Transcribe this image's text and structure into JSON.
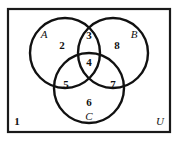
{
  "figure": {
    "type": "venn-diagram",
    "set_count": 3,
    "background_color": "#ffffff",
    "stroke_color": "#111111"
  },
  "universe": {
    "label": "U",
    "rect": {
      "x": 8,
      "y": 9,
      "width": 162,
      "height": 123
    }
  },
  "sets": [
    {
      "key": "A",
      "label": "A",
      "cx": 65,
      "cy": 53,
      "r": 35,
      "label_x": 44,
      "label_y": 35
    },
    {
      "key": "B",
      "label": "B",
      "cx": 113,
      "cy": 53,
      "r": 35,
      "label_x": 134,
      "label_y": 35
    },
    {
      "key": "C",
      "label": "C",
      "cx": 89,
      "cy": 88,
      "r": 35,
      "label_x": 89,
      "label_y": 117
    }
  ],
  "regions": [
    {
      "key": "outside",
      "label": "1",
      "description": "outside all sets",
      "x": 17,
      "y": 122
    },
    {
      "key": "A_only",
      "label": "2",
      "description": "A only",
      "x": 62,
      "y": 46
    },
    {
      "key": "A_and_B",
      "label": "3",
      "description": "A and B only",
      "x": 89,
      "y": 36
    },
    {
      "key": "A_B_C",
      "label": "4",
      "description": "A and B and C",
      "x": 89,
      "y": 63
    },
    {
      "key": "A_and_C",
      "label": "5",
      "description": "A and C only",
      "x": 66,
      "y": 85
    },
    {
      "key": "C_only",
      "label": "6",
      "description": "C only",
      "x": 89,
      "y": 103
    },
    {
      "key": "B_and_C",
      "label": "7",
      "description": "B and C only",
      "x": 113,
      "y": 85
    },
    {
      "key": "B_only",
      "label": "8",
      "description": "B only",
      "x": 117,
      "y": 46
    }
  ]
}
